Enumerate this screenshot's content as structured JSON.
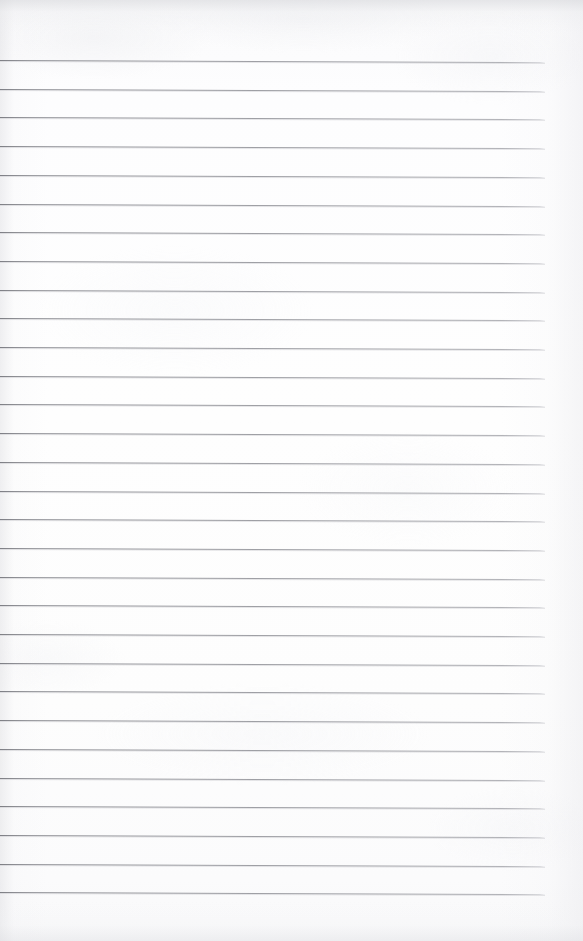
{
  "document": {
    "kind": "scanned-lined-notebook-page",
    "title": "",
    "visible_text": "",
    "page_width": 583,
    "page_height": 941,
    "background_color": "#fdfdfd",
    "has_handwriting": false,
    "has_printed_text": false,
    "notes": "Blank ruled page; no text, headings, numbers or marks are visible in the pixels."
  },
  "ruling": {
    "line_color": "#8a8b91",
    "line_thickness_px": 1,
    "line_count": 30,
    "first_line_y": 60,
    "line_spacing_px": 28.7,
    "line_left_x": 0,
    "line_right_x": 545,
    "skew_degrees": 0.22,
    "left_margin_rule": false,
    "right_margin_rule": false,
    "header_gap_px": 60,
    "footer_gap_px": 49
  },
  "margins": {
    "top_blank_band": "60px of unruled paper above the first rule",
    "right_blank_band": "38px of unruled paper right of the rule ends",
    "bottom_blank_band": "49px of unruled paper below the last rule"
  },
  "scan_artifacts": {
    "vignette": true,
    "vignette_color": "#d8d8dc",
    "paper_grain": true,
    "grain_color": "#eceded",
    "top_edge_shadow": true,
    "bottom_edge_shadow": true
  }
}
